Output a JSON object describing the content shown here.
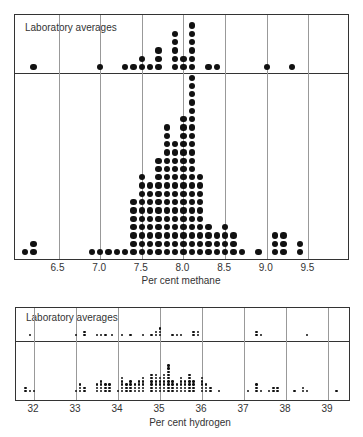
{
  "chart_data": [
    {
      "type": "scatter",
      "title": "",
      "xlabel": "Per cent methane",
      "ylabel": "",
      "xlim": [
        6.05,
        9.98
      ],
      "xticks": [
        "6.5",
        "7.0",
        "7.5",
        "8.0",
        "8.5",
        "9.0",
        "9.5"
      ],
      "grid": true,
      "subpanels": [
        {
          "name": "Laboratory averages",
          "label": "Laboratory averages",
          "x": [
            6.2,
            7.0,
            7.3,
            7.4,
            7.5,
            7.6,
            7.7,
            7.9,
            8.0,
            8.1,
            8.3,
            8.4,
            9.0,
            9.3
          ],
          "counts": [
            1,
            1,
            1,
            1,
            2,
            1,
            3,
            5,
            2,
            6,
            1,
            1,
            1,
            1
          ]
        },
        {
          "name": "Individual determinations",
          "label": "",
          "x": [
            6.1,
            6.2,
            6.9,
            7.0,
            7.1,
            7.2,
            7.3,
            7.4,
            7.5,
            7.6,
            7.7,
            7.8,
            7.9,
            8.0,
            8.1,
            8.2,
            8.3,
            8.4,
            8.5,
            8.6,
            8.7,
            8.9,
            9.1,
            9.2,
            9.4
          ],
          "counts": [
            1,
            2,
            1,
            1,
            1,
            1,
            1,
            7,
            10,
            9,
            12,
            16,
            14,
            17,
            22,
            10,
            4,
            3,
            4,
            3,
            1,
            1,
            3,
            3,
            2
          ]
        }
      ]
    },
    {
      "type": "scatter",
      "title": "",
      "xlabel": "Per cent hydrogen",
      "ylabel": "",
      "xlim": [
        31.6,
        40.2
      ],
      "xticks": [
        "32",
        "33",
        "34",
        "35",
        "36",
        "37",
        "38",
        "39"
      ],
      "grid": true,
      "subpanels": [
        {
          "name": "Laboratory averages",
          "label": "Laboratory averages",
          "x": [
            31.9,
            33.0,
            33.2,
            33.5,
            33.6,
            33.7,
            33.85,
            34.1,
            34.3,
            34.6,
            34.8,
            34.9,
            35.0,
            35.3,
            35.4,
            35.5,
            35.8,
            35.9,
            37.3,
            37.4,
            38.5
          ],
          "counts": [
            1,
            1,
            2,
            1,
            1,
            1,
            1,
            1,
            1,
            1,
            1,
            2,
            3,
            1,
            1,
            1,
            2,
            2,
            2,
            1,
            1
          ]
        },
        {
          "name": "Individual determinations",
          "label": "",
          "x": [
            31.8,
            31.9,
            32.0,
            33.0,
            33.1,
            33.2,
            33.5,
            33.6,
            33.7,
            33.8,
            34.0,
            34.1,
            34.2,
            34.3,
            34.4,
            34.5,
            34.6,
            34.8,
            34.9,
            35.0,
            35.1,
            35.2,
            35.3,
            35.4,
            35.5,
            35.6,
            35.7,
            35.8,
            36.0,
            36.1,
            36.2,
            36.4,
            37.1,
            37.3,
            37.4,
            37.6,
            37.7,
            37.8,
            38.2,
            38.4,
            38.5,
            39.2
          ],
          "counts": [
            2,
            1,
            1,
            1,
            3,
            2,
            3,
            4,
            3,
            3,
            1,
            5,
            3,
            4,
            3,
            4,
            5,
            6,
            6,
            5,
            6,
            9,
            4,
            3,
            5,
            4,
            6,
            4,
            5,
            3,
            2,
            1,
            1,
            3,
            1,
            1,
            2,
            2,
            1,
            2,
            1,
            1
          ]
        }
      ]
    }
  ],
  "methane": {
    "averages_label": "Laboratory averages",
    "xlabel": "Per cent methane",
    "ticks": [
      "6.5",
      "7.0",
      "7.5",
      "8.0",
      "8.5",
      "9.0",
      "9.5"
    ]
  },
  "hydrogen": {
    "averages_label": "Laboratory averages",
    "xlabel": "Per cent hydrogen",
    "ticks": [
      "32",
      "33",
      "34",
      "35",
      "36",
      "37",
      "38",
      "39"
    ]
  }
}
